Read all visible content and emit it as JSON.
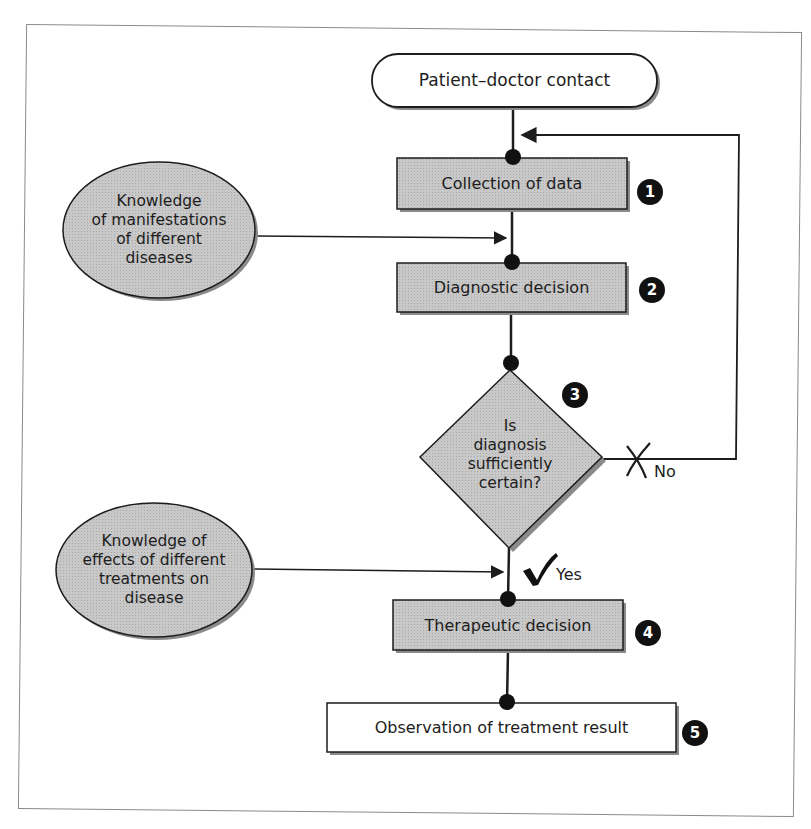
{
  "diagram": {
    "type": "flowchart",
    "colors": {
      "box_fill": "#c4c4c4",
      "terminal_fill": "#ffffff",
      "stroke": "#1d1d1d",
      "shadow": "#7a7a7a",
      "badge": "#111111",
      "frame": "#8a8a8a"
    },
    "start": {
      "label": "Patient–doctor contact"
    },
    "steps": [
      {
        "id": 1,
        "label": "Collection of data",
        "badge": "1"
      },
      {
        "id": 2,
        "label": "Diagnostic decision",
        "badge": "2"
      },
      {
        "id": 3,
        "label_lines": [
          "Is",
          "diagnosis",
          "sufficiently",
          "certain?"
        ],
        "badge": "3",
        "shape": "diamond"
      },
      {
        "id": 4,
        "label": "Therapeutic decision",
        "badge": "4"
      },
      {
        "id": 5,
        "label": "Observation of treatment result",
        "badge": "5",
        "shape": "white-box"
      }
    ],
    "inputs": [
      {
        "label_lines": [
          "Knowledge",
          "of manifestations",
          "of different",
          "diseases"
        ],
        "target": "between step 1 and step 2"
      },
      {
        "label_lines": [
          "Knowledge of",
          "effects of different",
          "treatments on",
          "disease"
        ],
        "target": "between step 3 and step 4"
      }
    ],
    "branches": {
      "no": {
        "label": "No",
        "mark": "✗",
        "target": "Collection of data (loop back)"
      },
      "yes": {
        "label": "Yes",
        "mark": "✓",
        "target": "Therapeutic decision"
      }
    }
  }
}
